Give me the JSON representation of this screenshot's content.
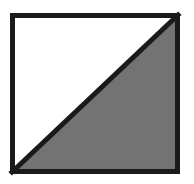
{
  "figure": {
    "name": "half-shaded-square",
    "canvas": {
      "width": 194,
      "height": 184,
      "background_color": "#FFFFFF"
    },
    "square": {
      "label": "outer-square",
      "left": 10,
      "top": 13,
      "right": 180,
      "bottom": 174,
      "width": 170,
      "height": 161,
      "border_color": "#1A1A1A",
      "border_width": 5,
      "fill_color": "#FFFFFF"
    },
    "diagonal": {
      "label": "diagonal-line",
      "from_corner": "top-right",
      "to_corner": "bottom-left",
      "x1": 178,
      "y1": 15,
      "x2": 12,
      "y2": 172,
      "color": "#1A1A1A",
      "stroke_width": 5
    },
    "regions": [
      {
        "label": "upper-left-triangle",
        "position": "upper-left",
        "fill_color": "#FFFFFF",
        "shaded": false,
        "fraction": "1/2",
        "points": "12,15 178,15 12,172"
      },
      {
        "label": "lower-right-triangle",
        "position": "lower-right",
        "fill_color": "#737373",
        "shaded": true,
        "fraction": "1/2",
        "points": "178,15 178,172 12,172"
      }
    ]
  }
}
